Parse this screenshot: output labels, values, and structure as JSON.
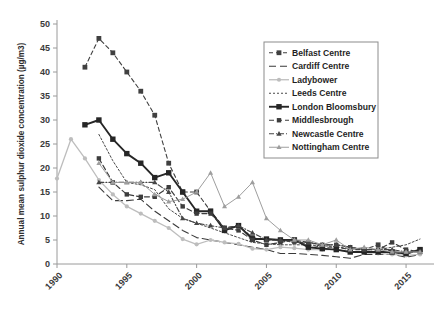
{
  "chart_data": {
    "type": "line",
    "title": "",
    "xlabel": "",
    "ylabel": "Annual mean sulphur dioxide concentration (µg/m3)",
    "xlim": [
      1990,
      2017
    ],
    "ylim": [
      0,
      50
    ],
    "ytick_values": [
      0,
      5,
      10,
      15,
      20,
      25,
      30,
      35,
      40,
      45,
      50
    ],
    "ytick_labels": [
      "0",
      "5",
      "10",
      "15",
      "20",
      "25",
      "30",
      "35",
      "40",
      "45",
      "50"
    ],
    "xtick_values": [
      1990,
      1995,
      2000,
      2005,
      2010,
      2015
    ],
    "xtick_labels": [
      "1990",
      "1995",
      "2000",
      "2005",
      "2010",
      "2015"
    ],
    "grid": false,
    "legend_position": "upper-right",
    "series": [
      {
        "name": "Belfast Centre",
        "color": "#404040",
        "dash": "4,3",
        "width": 1.1,
        "marker": "square",
        "marker_size": 2.4,
        "x": [
          1992,
          1993,
          1994,
          1995,
          1996,
          1997,
          1998,
          1999,
          2000,
          2001,
          2002,
          2003,
          2004,
          2005,
          2006,
          2007,
          2008,
          2009,
          2010,
          2011,
          2012,
          2013,
          2014,
          2015,
          2016
        ],
        "y": [
          41,
          47,
          44,
          40,
          36,
          31,
          21,
          15,
          15,
          11,
          7.5,
          8,
          5.5,
          5,
          5,
          5,
          4,
          3.5,
          3.5,
          3,
          3,
          4,
          2.5,
          2,
          3
        ]
      },
      {
        "name": "Cardiff Centre",
        "color": "#3a3a3a",
        "dash": "7,4",
        "width": 1.1,
        "marker": "none",
        "marker_size": 0,
        "x": [
          1993,
          1994,
          1995,
          1996,
          1997,
          1998,
          1999,
          2000,
          2001,
          2002,
          2003,
          2004,
          2005,
          2006,
          2007,
          2008,
          2009,
          2010,
          2011,
          2012,
          2013,
          2014,
          2015,
          2016
        ],
        "y": [
          16,
          13.2,
          13.2,
          13.5,
          11,
          9,
          7,
          5.5,
          5,
          4.5,
          4,
          3.5,
          3,
          2.2,
          2.2,
          2,
          1.8,
          1.5,
          1.2,
          2,
          2,
          2,
          1.4,
          2
        ]
      },
      {
        "name": "Ladybower",
        "color": "#bdbdbd",
        "dash": "none",
        "width": 1.3,
        "marker": "circle",
        "marker_size": 2.1,
        "x": [
          1990,
          1991,
          1992,
          1993,
          1994,
          1995,
          1996,
          1997,
          1998,
          1999,
          2000,
          2001,
          2002,
          2003,
          2004,
          2005,
          2006,
          2007,
          2008,
          2009,
          2010,
          2011,
          2012,
          2013,
          2014,
          2015,
          2016
        ],
        "y": [
          17.8,
          26,
          22,
          17.5,
          14.5,
          12,
          10.5,
          9,
          7.5,
          5.2,
          4.1,
          5,
          4.5,
          4.2,
          3.2,
          3,
          3.5,
          3.3,
          3,
          3,
          3,
          2.5,
          2.5,
          2.2,
          2,
          1.8,
          2
        ]
      },
      {
        "name": "Leeds Centre",
        "color": "#4a4a4a",
        "dash": "2,2",
        "width": 1.0,
        "marker": "none",
        "marker_size": 0,
        "x": [
          1993,
          1994,
          1995,
          1996,
          1997,
          1998,
          1999,
          2000,
          2001,
          2002,
          2003,
          2004,
          2005,
          2006,
          2007,
          2008,
          2009,
          2010,
          2011,
          2012,
          2013,
          2014,
          2015,
          2016
        ],
        "y": [
          27,
          21.5,
          17,
          16.5,
          15.5,
          11.5,
          9.5,
          8.5,
          7.5,
          6.5,
          5.5,
          4.5,
          4.2,
          4,
          4,
          4,
          3.8,
          3.6,
          3.2,
          3,
          3,
          3.5,
          4,
          5.2
        ]
      },
      {
        "name": "London Bloomsbury",
        "color": "#262626",
        "dash": "none",
        "width": 1.9,
        "marker": "square",
        "marker_size": 2.7,
        "x": [
          1992,
          1993,
          1994,
          1995,
          1996,
          1997,
          1998,
          1999,
          2000,
          2001,
          2002,
          2003,
          2004,
          2005,
          2006,
          2007,
          2008,
          2009,
          2010,
          2011,
          2012,
          2013,
          2014,
          2015,
          2016
        ],
        "y": [
          29,
          30,
          26,
          23,
          21,
          18,
          19,
          15,
          11,
          11,
          7,
          8,
          5.2,
          5.2,
          5,
          5,
          3.5,
          3.2,
          3,
          2.5,
          2.5,
          2.5,
          2.5,
          2.2,
          3
        ]
      },
      {
        "name": "Middlesbrough",
        "color": "#3d3d3d",
        "dash": "5,3",
        "width": 1.2,
        "marker": "square",
        "marker_size": 2.2,
        "x": [
          1993,
          1994,
          1995,
          1996,
          1997,
          1998,
          1999,
          2000,
          2001,
          2002,
          2003,
          2004,
          2005,
          2006,
          2007,
          2008,
          2009,
          2010,
          2011,
          2012,
          2013,
          2014,
          2015,
          2016
        ],
        "y": [
          22,
          17,
          14.5,
          14,
          14,
          16,
          12,
          10.5,
          10.5,
          7.5,
          7,
          5,
          4,
          4.5,
          5,
          4.5,
          4,
          4,
          3.5,
          3,
          3,
          4.5,
          3,
          2.5
        ]
      },
      {
        "name": "Newcastle Centre",
        "color": "#454545",
        "dash": "5,2,1,2",
        "width": 1.1,
        "marker": "triangle",
        "marker_size": 2.4,
        "x": [
          1993,
          1994,
          1995,
          1996,
          1997,
          1998,
          1999,
          2000,
          2001,
          2002,
          2003,
          2004,
          2005,
          2006,
          2007,
          2008,
          2009,
          2010,
          2011,
          2012,
          2013,
          2014,
          2015,
          2016
        ],
        "y": [
          17,
          17,
          17,
          17,
          17,
          15,
          9.5,
          8.5,
          8,
          7.5,
          8,
          6.5,
          5,
          5,
          4.5,
          4.5,
          4,
          4,
          3.5,
          3,
          3,
          3,
          2.5,
          2.5
        ]
      },
      {
        "name": "Nottingham Centre",
        "color": "#9e9e9e",
        "dash": "none",
        "width": 1.0,
        "marker": "triangle",
        "marker_size": 2.3,
        "x": [
          1993,
          1994,
          1995,
          1996,
          1997,
          1998,
          1999,
          2000,
          2001,
          2002,
          2003,
          2004,
          2005,
          2006,
          2007,
          2008,
          2009,
          2010,
          2011,
          2012,
          2013,
          2014,
          2015,
          2016
        ],
        "y": [
          21,
          17,
          17,
          17,
          14.5,
          13,
          13.5,
          15,
          19,
          12,
          14,
          17,
          9.5,
          7,
          5,
          5,
          4,
          5,
          3,
          3.5,
          3,
          2.5,
          2.5,
          2.5
        ]
      }
    ]
  },
  "legend": {
    "items": [
      {
        "label": "Belfast Centre"
      },
      {
        "label": "Cardiff Centre"
      },
      {
        "label": "Ladybower"
      },
      {
        "label": "Leeds Centre"
      },
      {
        "label": "London Bloomsbury"
      },
      {
        "label": "Middlesbrough"
      },
      {
        "label": "Newcastle Centre"
      },
      {
        "label": "Nottingham Centre"
      }
    ]
  }
}
